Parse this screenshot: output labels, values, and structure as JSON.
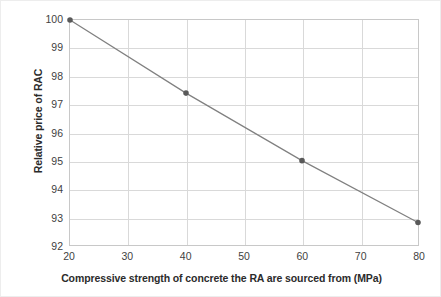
{
  "chart_data": {
    "type": "line",
    "title": "",
    "xlabel": "Compressive strength of concrete the RA are sourced from (MPa)",
    "ylabel": "Relative price of RAC",
    "x": [
      20,
      40,
      60,
      80
    ],
    "values": [
      100,
      97.4,
      95.0,
      92.8
    ],
    "series": [
      {
        "name": "Relative price of RAC",
        "x": [
          20,
          40,
          60,
          80
        ],
        "values": [
          100,
          97.4,
          95.0,
          92.8
        ]
      }
    ],
    "xlim": [
      20,
      80
    ],
    "ylim": [
      92,
      100
    ],
    "xticks": [
      "20",
      "30",
      "40",
      "50",
      "60",
      "70",
      "80"
    ],
    "yticks": [
      "92",
      "93",
      "94",
      "95",
      "96",
      "97",
      "98",
      "99",
      "100"
    ],
    "xtick_values": [
      20,
      30,
      40,
      50,
      60,
      70,
      80
    ],
    "ytick_values": [
      92,
      93,
      94,
      95,
      96,
      97,
      98,
      99,
      100
    ],
    "grid": true,
    "legend": false,
    "legend_position": "none",
    "marker": "circle",
    "line_color": "#808080",
    "marker_color": "#595959",
    "grid_color": "#d9d9d9",
    "axis_color": "#c8c8c8",
    "background_color": "#ffffff",
    "annotations": []
  }
}
